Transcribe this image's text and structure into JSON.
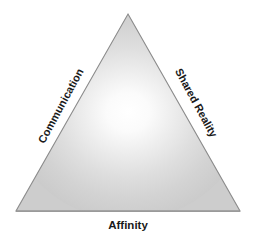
{
  "diagram": {
    "type": "triangle",
    "shape": {
      "apex": {
        "x": 128,
        "y": 14
      },
      "bottom_left": {
        "x": 16,
        "y": 211
      },
      "bottom_right": {
        "x": 240,
        "y": 211
      },
      "fill_base_color": "#cfcfcf",
      "fill_highlight_color": "#fdfdfd",
      "highlight_center": {
        "x": 128,
        "y": 112
      },
      "stroke_color": "#8c8c8c",
      "stroke_width": 1
    },
    "background_color": "#ffffff",
    "label_color": "#1a1a1a",
    "labels": {
      "left_edge": "Communication",
      "right_edge": "Shared Reality",
      "bottom_edge": "Affinity"
    }
  }
}
